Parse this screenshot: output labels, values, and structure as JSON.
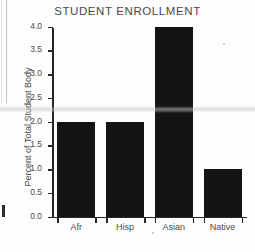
{
  "chart_data": {
    "type": "bar",
    "title": "STUDENT ENROLLMENT",
    "xlabel": "",
    "ylabel": "Percent of Total Student Body",
    "categories": [
      "Afr",
      "Hisp",
      "Asian",
      "Native"
    ],
    "values": [
      2.0,
      2.0,
      4.0,
      1.0
    ],
    "ylim": [
      0.0,
      4.0
    ],
    "ytick_labels": [
      "0.0",
      "0.5",
      "1.0",
      "1.5",
      "2.0",
      "2.5",
      "3.0",
      "3.5",
      "4.0"
    ],
    "ytick_values": [
      0.0,
      0.5,
      1.0,
      1.5,
      2.0,
      2.5,
      3.0,
      3.5,
      4.0
    ],
    "grid": false,
    "legend": null,
    "bar_color": "#141414",
    "axis_color": "#262626",
    "text_color": "#4a4a4a",
    "background_color": "#fdfdfd"
  }
}
